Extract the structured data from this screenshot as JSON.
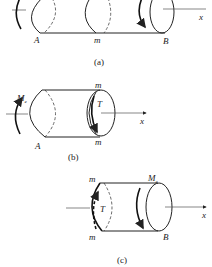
{
  "figure": {
    "panels": [
      {
        "id": "a",
        "caption": "(a)",
        "labels": {
          "left_end": "A",
          "middle": "m",
          "right_end": "B",
          "axis": "x"
        }
      },
      {
        "id": "b",
        "caption": "(b)",
        "labels": {
          "moment": "M",
          "moment_sub": "e",
          "top_section": "m",
          "bottom_section": "m",
          "torque": "T",
          "left_end": "A",
          "axis": "x"
        }
      },
      {
        "id": "c",
        "caption": "(c)",
        "labels": {
          "moment": "M",
          "moment_sub": "e",
          "top_section": "m",
          "bottom_section": "m",
          "torque": "T",
          "right_end": "B",
          "axis": "x"
        }
      }
    ]
  }
}
